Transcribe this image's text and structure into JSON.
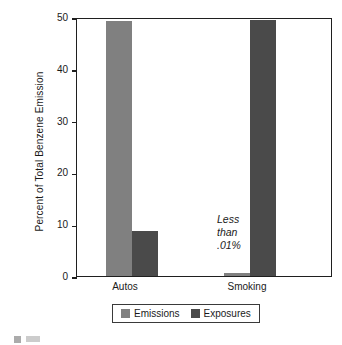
{
  "chart_data": {
    "type": "bar",
    "title": "",
    "subtitle": "",
    "xlabel": "",
    "ylabel": "Percent of Total Benzene Emission",
    "categories": [
      "Autos",
      "Smoking"
    ],
    "series": [
      {
        "name": "Emissions",
        "color": "#808080",
        "values": [
          49.3,
          0.01
        ]
      },
      {
        "name": "Exposures",
        "color": "#4a4a4a",
        "values": [
          8.7,
          49.5
        ]
      }
    ],
    "ylim": [
      0,
      50
    ],
    "yticks": [
      0,
      10,
      20,
      30,
      40,
      50
    ],
    "ytick_labels": [
      "0",
      "10",
      "20",
      "30",
      "40",
      "50"
    ],
    "grid": false,
    "legend_position": "bottom",
    "annotations": [
      {
        "text": "Less\nthan\n.01%",
        "target_series": "Emissions",
        "target_category": "Smoking",
        "style": "italic"
      }
    ]
  },
  "axes": {
    "y_title": "Percent of Total Benzene Emission",
    "y_ticks": [
      {
        "label": "50",
        "value": 50
      },
      {
        "label": "40",
        "value": 40
      },
      {
        "label": "30",
        "value": 30
      },
      {
        "label": "20",
        "value": 20
      },
      {
        "label": "10",
        "value": 10
      },
      {
        "label": "0",
        "value": 0
      }
    ],
    "x_ticks": [
      {
        "label": "Autos"
      },
      {
        "label": "Smoking"
      }
    ]
  },
  "bars": [
    {
      "name": "autos-emissions",
      "series": "Emissions",
      "category": "Autos",
      "value": 49.3,
      "color": "#808080"
    },
    {
      "name": "autos-exposures",
      "series": "Exposures",
      "category": "Autos",
      "value": 8.7,
      "color": "#4a4a4a"
    },
    {
      "name": "smoking-emissions",
      "series": "Emissions",
      "category": "Smoking",
      "value": 0.01,
      "color": "#808080"
    },
    {
      "name": "smoking-exposures",
      "series": "Exposures",
      "category": "Smoking",
      "value": 49.5,
      "color": "#4a4a4a"
    }
  ],
  "annotation": {
    "line1": "Less",
    "line2": "than",
    "line3": ".01%"
  },
  "legend": {
    "items": [
      {
        "label": "Emissions",
        "color": "#808080"
      },
      {
        "label": "Exposures",
        "color": "#4a4a4a"
      }
    ]
  },
  "colors": {
    "emissions": "#808080",
    "exposures": "#4a4a4a",
    "axis": "#1f1f1f",
    "text": "#1a1a1a",
    "background": "#ffffff"
  }
}
